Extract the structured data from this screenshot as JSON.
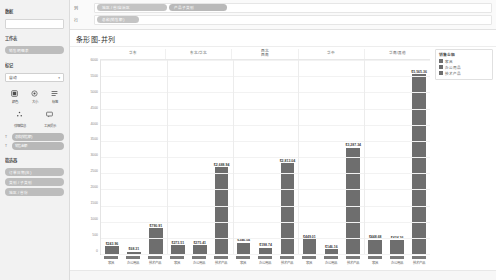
{
  "sidebar": {
    "data_section_label": "数据",
    "data_source_box_value": "",
    "sheets_section_label": "工作表",
    "sheet_pill_label": "销售明细表",
    "marks_section_label": "标记",
    "marks_type_value": "自动",
    "marks_caret": "▾",
    "mark_buttons": [
      {
        "icon": "color-icon",
        "label": "颜色"
      },
      {
        "icon": "size-icon",
        "label": "大小"
      },
      {
        "icon": "text-icon",
        "label": "标签"
      },
      {
        "icon": "detail-icon",
        "label": "详细信息"
      },
      {
        "icon": "tooltip-icon",
        "label": "工具提示"
      }
    ],
    "mark_field_pills": [
      {
        "tag": "T",
        "label": "总和(销售额)"
      },
      {
        "tag": "T",
        "label": "销售金额"
      }
    ],
    "filters_section_label": "筛选器",
    "filter_pills": [
      {
        "label": "订单日期(年)"
      },
      {
        "label": "类别 / 子类别"
      },
      {
        "label": "地区 / 省份"
      }
    ]
  },
  "shelves": {
    "columns_label": "列",
    "rows_label": "行",
    "columns_pills": [
      {
        "label": "地区 / 省/自治区"
      },
      {
        "label": "产品子类别"
      }
    ],
    "rows_pills": [
      {
        "label": "总和(销售额)"
      }
    ]
  },
  "header": {
    "chart_title": "条形图-并列"
  },
  "legend": {
    "title": "销售金额",
    "items": [
      {
        "label": "家具",
        "color": "#6e6e6e"
      },
      {
        "label": "办公用品",
        "color": "#6e6e6e"
      },
      {
        "label": "技术产品",
        "color": "#6e6e6e"
      }
    ]
  },
  "chart_data": {
    "type": "bar",
    "title": "条形图-并列",
    "xlabel": "",
    "ylabel": "销售额",
    "ylim": [
      0,
      6000
    ],
    "grid": true,
    "legend_position": "right",
    "group_header_label": "地区",
    "groups": [
      "华东",
      "东北/华北",
      "西北\n西南",
      "华中",
      "华南/其他"
    ],
    "categories": [
      "家具",
      "办公用品",
      "技术产品",
      "家具",
      "办公用品",
      "技术产品",
      "家具",
      "办公用品",
      "技术产品",
      "家具",
      "办公用品",
      "技术产品",
      "家具",
      "办公用品",
      "技术产品"
    ],
    "values": [
      243.96,
      68.31,
      790.91,
      273.51,
      275.41,
      2688.94,
      346.54,
      198.74,
      2813.04,
      449.01,
      146.16,
      3287.34,
      448.68,
      424.36,
      5565.36
    ],
    "value_labels": [
      "$243.96",
      "$68.31",
      "$790.91",
      "$273.51",
      "$275.41",
      "$2,688.94",
      "$346.54",
      "$198.74",
      "$2,813.04",
      "$449.01",
      "$146.16",
      "$3,287.34",
      "$448.68",
      "$424.36",
      "$5,565.36"
    ],
    "yticks": [
      "6000",
      "5500",
      "5000",
      "4500",
      "4000",
      "3500",
      "3000",
      "2500",
      "2000",
      "1500",
      "1000",
      "500",
      "0"
    ],
    "bar_color": "#6e6e6e"
  }
}
